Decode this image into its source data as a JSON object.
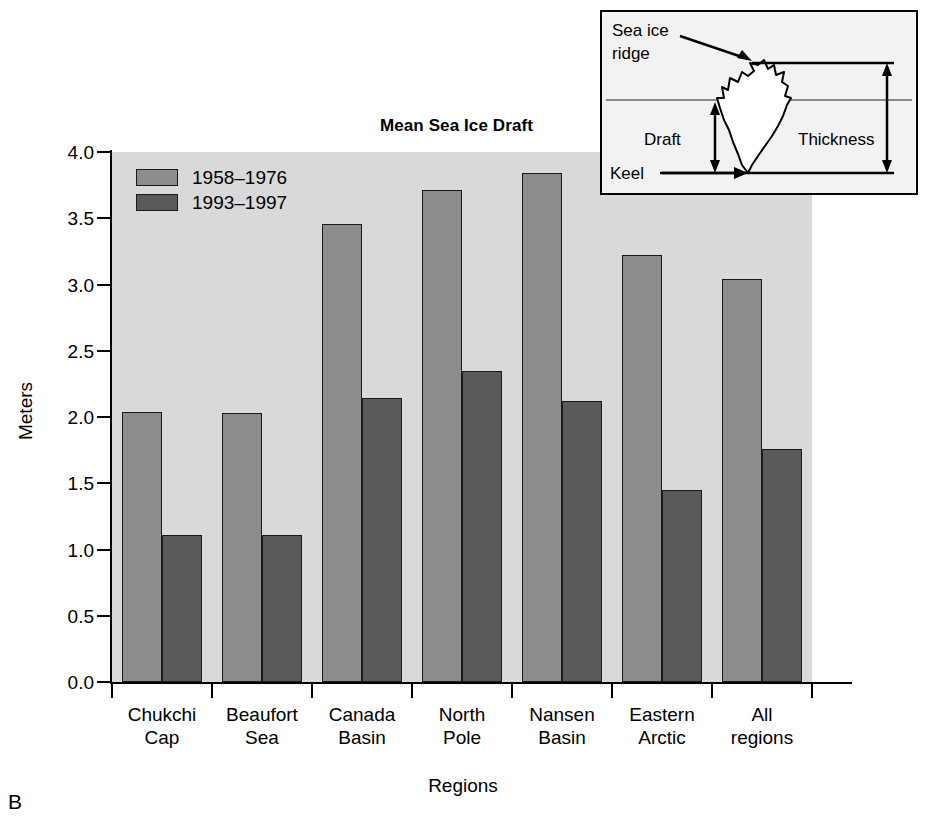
{
  "panel_letter": "B",
  "chart_data": {
    "type": "bar",
    "title": "Mean Sea Ice Draft",
    "xlabel": "Regions",
    "ylabel": "Meters",
    "ylim": [
      0.0,
      4.0
    ],
    "ytick_labels": [
      "4.0",
      "3.5",
      "3.0",
      "2.5",
      "2.0",
      "1.5",
      "1.0",
      "0.5",
      "0.0"
    ],
    "ytick_values": [
      4.0,
      3.5,
      3.0,
      2.5,
      2.0,
      1.5,
      1.0,
      0.5,
      0.0
    ],
    "grid": false,
    "legend_position": "upper-left-inside",
    "categories": [
      "Chukchi\nCap",
      "Beaufort\nSea",
      "Canada\nBasin",
      "North\nPole",
      "Nansen\nBasin",
      "Eastern\nArctic",
      "All\nregions"
    ],
    "category_lines": [
      [
        "Chukchi",
        "Cap"
      ],
      [
        "Beaufort",
        "Sea"
      ],
      [
        "Canada",
        "Basin"
      ],
      [
        "North",
        "Pole"
      ],
      [
        "Nansen",
        "Basin"
      ],
      [
        "Eastern",
        "Arctic"
      ],
      [
        "All",
        "regions"
      ]
    ],
    "series": [
      {
        "name": "1958–1976",
        "color": "#8c8c8c",
        "values": [
          2.04,
          2.03,
          3.46,
          3.71,
          3.84,
          3.22,
          3.04
        ]
      },
      {
        "name": "1993–1997",
        "color": "#5a5a5a",
        "values": [
          1.11,
          1.11,
          2.14,
          2.35,
          2.12,
          1.45,
          1.76
        ]
      }
    ]
  },
  "legend": {
    "items": [
      {
        "label": "1958–1976",
        "color": "#8c8c8c"
      },
      {
        "label": "1993–1997",
        "color": "#5a5a5a"
      }
    ]
  },
  "inset": {
    "labels": {
      "sea_ice_ridge_line1": "Sea ice",
      "sea_ice_ridge_line2": "ridge",
      "keel": "Keel",
      "draft": "Draft",
      "thickness": "Thickness"
    }
  },
  "colors": {
    "plot_background": "#d9d9d9",
    "series_1958_1976": "#8c8c8c",
    "series_1993_1997": "#5a5a5a",
    "axis": "#000000",
    "inset_background": "#f2f2f2"
  }
}
